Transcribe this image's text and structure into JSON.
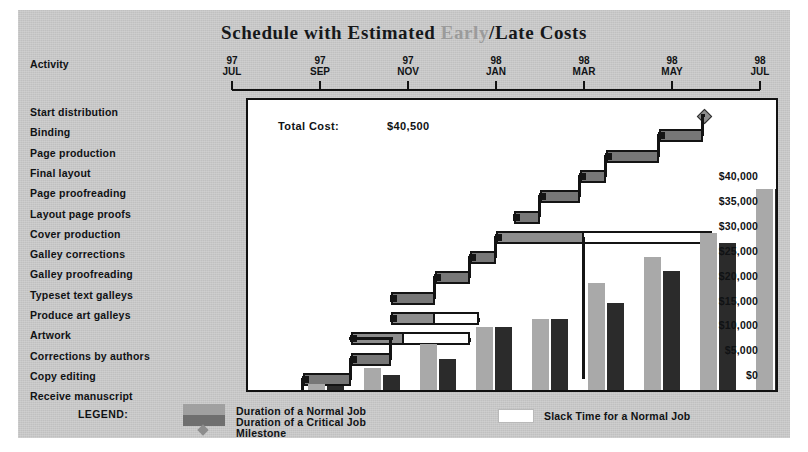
{
  "header": {
    "title_part1": "Schedule with Estimated ",
    "title_early": "Early",
    "title_part2": "/Late",
    "title_part3": " Costs"
  },
  "activity_header": "Activity",
  "total_cost": {
    "label": "Total Cost:",
    "value": "$40,500"
  },
  "legend": {
    "title": "LEGEND:",
    "normal": "Duration of a Normal Job",
    "critical": "Duration of a Critical Job",
    "milestone": "Milestone",
    "slack": "Slack Time for a Normal Job"
  },
  "colors": {
    "panel": "#c8c8c8",
    "normal_job": "#8d8d8d",
    "critical_job": "#777777",
    "slack": "#ffffff",
    "early_cost_bar": "#a9a9a9",
    "late_cost_bar": "#2b2b2b",
    "outline": "#141414",
    "title_dim": "#9b9b9b"
  },
  "chart_data": {
    "type": "bar",
    "title": "Schedule with Estimated Early/Late Costs",
    "subtype": "gantt-with-paired-cumulative-cost-bars",
    "xlabel": "",
    "ylabel": "",
    "grid": false,
    "legend_position": "bottom",
    "x_axis": {
      "ticks": [
        {
          "year": "97",
          "month": "JUL"
        },
        {
          "year": "97",
          "month": "SEP"
        },
        {
          "year": "97",
          "month": "NOV"
        },
        {
          "year": "98",
          "month": "JAN"
        },
        {
          "year": "98",
          "month": "MAR"
        },
        {
          "year": "98",
          "month": "MAY"
        },
        {
          "year": "98",
          "month": "JUL"
        }
      ]
    },
    "y_axis": {
      "tick_labels": [
        "$40,000",
        "$35,000",
        "$30,000",
        "$25,000",
        "$20,000",
        "$15,000",
        "$10,000",
        "$5,000",
        "$0"
      ],
      "ylim": [
        0,
        40000
      ],
      "step": 5000
    },
    "activities": [
      {
        "name": "Start distribution",
        "type": "milestone",
        "start_month": 10.3,
        "end_month": 10.3,
        "slack_months": 0
      },
      {
        "name": "Binding",
        "type": "critical",
        "start_month": 9.3,
        "end_month": 10.3,
        "slack_months": 0
      },
      {
        "name": "Page production",
        "type": "critical",
        "start_month": 8.1,
        "end_month": 9.3,
        "slack_months": 0
      },
      {
        "name": "Final layout",
        "type": "critical",
        "start_month": 7.5,
        "end_month": 8.1,
        "slack_months": 0
      },
      {
        "name": "Page proofreading",
        "type": "critical",
        "start_month": 6.6,
        "end_month": 7.5,
        "slack_months": 0
      },
      {
        "name": "Layout page proofs",
        "type": "critical",
        "start_month": 6.0,
        "end_month": 6.6,
        "slack_months": 0
      },
      {
        "name": "Cover production",
        "type": "normal",
        "start_month": 5.6,
        "end_month": 7.6,
        "slack_months": 2.9
      },
      {
        "name": "Galley corrections",
        "type": "critical",
        "start_month": 5.0,
        "end_month": 5.6,
        "slack_months": 0
      },
      {
        "name": "Galley proofreading",
        "type": "critical",
        "start_month": 4.2,
        "end_month": 5.0,
        "slack_months": 0
      },
      {
        "name": "Typeset text galleys",
        "type": "critical",
        "start_month": 3.2,
        "end_month": 4.2,
        "slack_months": 0
      },
      {
        "name": "Produce art galleys",
        "type": "normal",
        "start_month": 3.2,
        "end_month": 4.2,
        "slack_months": 1.0
      },
      {
        "name": "Artwork",
        "type": "normal",
        "start_month": 2.3,
        "end_month": 3.5,
        "slack_months": 1.5
      },
      {
        "name": "Corrections by authors",
        "type": "critical",
        "start_month": 2.3,
        "end_month": 3.2,
        "slack_months": 0
      },
      {
        "name": "Copy editing",
        "type": "critical",
        "start_month": 1.2,
        "end_month": 2.3,
        "slack_months": 0
      },
      {
        "name": "Receive manuscript",
        "type": "milestone",
        "start_month": 1.2,
        "end_month": 1.2,
        "slack_months": 0
      }
    ],
    "cost_bars": {
      "series": [
        {
          "name": "Early cost",
          "values": [
            1200,
            4400,
            9300,
            12700,
            14300,
            21500,
            26800,
            31500,
            40500
          ]
        },
        {
          "name": "Late cost",
          "values": [
            900,
            3100,
            6200,
            12700,
            14300,
            17500,
            24000,
            29600,
            40500
          ]
        }
      ],
      "categories": [
        "1",
        "2",
        "3",
        "4",
        "5",
        "6",
        "7",
        "8",
        "9"
      ]
    }
  }
}
